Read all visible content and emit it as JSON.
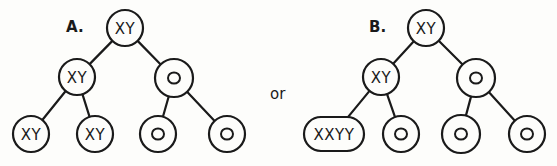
{
  "connector_label": "or",
  "colors": {
    "ink": "#1a1a1a",
    "paper": "#fdfdfb"
  },
  "panels": [
    {
      "id": "A",
      "label": "A.",
      "label_pos": [
        66,
        32
      ],
      "nodes": [
        {
          "id": "a-root",
          "text": "XY",
          "shape": "circle",
          "cx": 125,
          "cy": 28,
          "r": 18
        },
        {
          "id": "a-l",
          "text": "XY",
          "shape": "circle",
          "cx": 77,
          "cy": 77,
          "r": 18
        },
        {
          "id": "a-r",
          "text": "O",
          "shape": "circle",
          "cx": 174,
          "cy": 78,
          "r": 19
        },
        {
          "id": "a-ll",
          "text": "XY",
          "shape": "circle",
          "cx": 31,
          "cy": 134,
          "r": 18
        },
        {
          "id": "a-lr",
          "text": "XY",
          "shape": "circle",
          "cx": 95,
          "cy": 134,
          "r": 18
        },
        {
          "id": "a-rl",
          "text": "O",
          "shape": "circle",
          "cx": 158,
          "cy": 134,
          "r": 18
        },
        {
          "id": "a-rr",
          "text": "O",
          "shape": "circle",
          "cx": 227,
          "cy": 134,
          "r": 18
        }
      ],
      "edges": [
        [
          "a-root",
          "a-l"
        ],
        [
          "a-root",
          "a-r"
        ],
        [
          "a-l",
          "a-ll"
        ],
        [
          "a-l",
          "a-lr"
        ],
        [
          "a-r",
          "a-rl"
        ],
        [
          "a-r",
          "a-rr"
        ]
      ]
    },
    {
      "id": "B",
      "label": "B.",
      "label_pos": [
        369,
        32
      ],
      "nodes": [
        {
          "id": "b-root",
          "text": "XY",
          "shape": "circle",
          "cx": 426,
          "cy": 28,
          "r": 18
        },
        {
          "id": "b-l",
          "text": "XY",
          "shape": "circle",
          "cx": 381,
          "cy": 77,
          "r": 18
        },
        {
          "id": "b-r",
          "text": "O",
          "shape": "circle",
          "cx": 476,
          "cy": 78,
          "r": 19
        },
        {
          "id": "b-ll",
          "text": "XXYY",
          "shape": "pill",
          "cx": 334,
          "cy": 134,
          "w": 60,
          "h": 34
        },
        {
          "id": "b-lr",
          "text": "O",
          "shape": "circle",
          "cx": 401,
          "cy": 134,
          "r": 18
        },
        {
          "id": "b-rl",
          "text": "O",
          "shape": "circle",
          "cx": 461,
          "cy": 134,
          "r": 19
        },
        {
          "id": "b-rr",
          "text": "O",
          "shape": "circle",
          "cx": 527,
          "cy": 134,
          "r": 18
        }
      ],
      "edges": [
        [
          "b-root",
          "b-l"
        ],
        [
          "b-root",
          "b-r"
        ],
        [
          "b-l",
          "b-ll"
        ],
        [
          "b-l",
          "b-lr"
        ],
        [
          "b-r",
          "b-rl"
        ],
        [
          "b-r",
          "b-rr"
        ]
      ]
    }
  ],
  "connector_pos": [
    270,
    99
  ]
}
